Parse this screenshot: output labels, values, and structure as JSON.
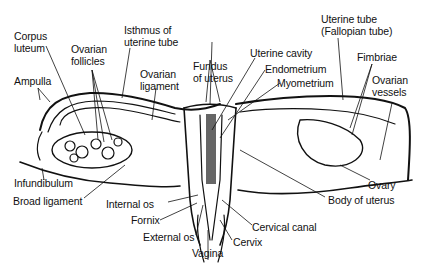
{
  "diagram": {
    "line_color": "#111111",
    "background": "#ffffff"
  },
  "labels": {
    "corpus_luteum": "Corpus\nluteum",
    "ovarian_follicles": "Ovarian\nfollicles",
    "isthmus": "Isthmus of\nuterine tube",
    "ampulla": "Ampulla",
    "ovarian_ligament": "Ovarian\nligament",
    "fundus": "Fundus\nof uterus",
    "uterine_cavity": "Uterine cavity",
    "endometrium": "Endometrium",
    "myometrium": "Myometrium",
    "uterine_tube": "Uterine tube\n(Fallopian tube)",
    "fimbriae": "Fimbriae",
    "ovarian_vessels": "Ovarian\nvessels",
    "infundibulum": "Infundibulum",
    "broad_ligament": "Broad ligament",
    "internal_os": "Internal os",
    "fornix": "Fornix",
    "external_os": "External os",
    "vagina": "Vagina",
    "cervix": "Cervix",
    "cervical_canal": "Cervical canal",
    "body_of_uterus": "Body of uterus",
    "ovary": "Ovary"
  }
}
